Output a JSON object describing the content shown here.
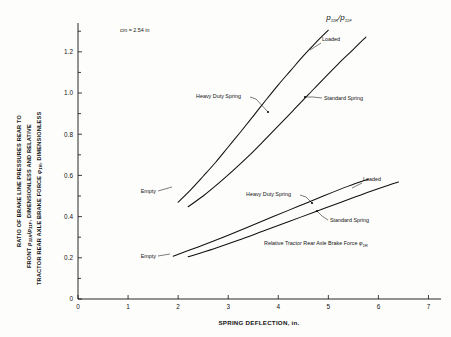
{
  "figure": {
    "note": "cm = 2.54 in",
    "formula_main": "p",
    "formula_sub1": "11R",
    "formula_slash": "/",
    "formula_main2": "p",
    "formula_sub2": "11F"
  },
  "axes": {
    "x": {
      "label": "SPRING DEFLECTION, in.",
      "ticks": [
        0,
        1,
        2,
        3,
        4,
        5,
        6,
        7
      ],
      "tick_labels": [
        "0",
        "1",
        "2",
        "3",
        "4",
        "5",
        "6",
        "7"
      ],
      "min": 0,
      "max": 7.25
    },
    "y": {
      "label_line1": "RATIO OF BRAKE LINE PRESSURES REAR  TO",
      "label_line2_a": "FRONT ",
      "label_line2_p1": "p",
      "label_line2_s1": "11R",
      "label_line2_slash": "/",
      "label_line2_p2": "p",
      "label_line2_s2": "11F",
      "label_line2_b": ", DIMENSIONLESS  AND RELATIVE",
      "label_line3_a": "TRACTOR REAR AXLE BRAKE FORCE ",
      "label_line3_phi": "φ",
      "label_line3_s": "1R",
      "label_line3_b": ", DIMENSIONLESS",
      "ticks": [
        0,
        0.2,
        0.4,
        0.6,
        0.8,
        1.0,
        1.2
      ],
      "tick_labels": [
        "0",
        "0.2",
        "0.4",
        "0.6",
        "0.8",
        "1.0",
        "1.2"
      ],
      "minor_ticks": [
        0.1,
        0.3,
        0.5,
        0.7,
        0.9,
        1.1,
        1.3
      ],
      "min": 0,
      "max": 1.34
    }
  },
  "annotations": {
    "upper_loaded": "Loaded",
    "upper_empty": "Empty",
    "upper_heavy": "Heavy Duty Spring",
    "upper_standard": "Standard Spring",
    "lower_loaded": "Loaded",
    "lower_empty": "Empty",
    "lower_heavy": "Heavy Duty Spring",
    "lower_standard": "Standard Spring",
    "relative_a": "Relative Tractor Rear  Axle Brake Force ",
    "relative_phi": "φ",
    "relative_sub": "1R"
  },
  "chart_data": {
    "type": "line",
    "title": "",
    "xlabel": "SPRING DEFLECTION, in.",
    "ylabel": "RATIO OF BRAKE LINE PRESSURES REAR TO FRONT p11R/p11F, DIMENSIONLESS AND RELATIVE TRACTOR REAR AXLE BRAKE FORCE phi-1R, DIMENSIONLESS",
    "xlim": [
      0,
      7.25
    ],
    "ylim": [
      0,
      1.34
    ],
    "grid": false,
    "legend": "inline-annotations",
    "series": [
      {
        "name": "Heavy Duty Spring (pressure ratio p11R/p11F)",
        "group": "upper",
        "start_label": "Empty",
        "end_label": "Loaded",
        "points": [
          [
            2.0,
            0.47
          ],
          [
            2.25,
            0.53
          ],
          [
            2.5,
            0.596
          ],
          [
            2.75,
            0.664
          ],
          [
            3.0,
            0.738
          ],
          [
            3.25,
            0.812
          ],
          [
            3.5,
            0.888
          ],
          [
            3.75,
            0.965
          ],
          [
            4.0,
            1.04
          ],
          [
            4.25,
            1.11
          ],
          [
            4.5,
            1.18
          ],
          [
            4.75,
            1.245
          ],
          [
            5.0,
            1.305
          ]
        ]
      },
      {
        "name": "Standard Spring (pressure ratio p11R/p11F)",
        "group": "upper",
        "start_label": "Empty",
        "end_label": "Loaded",
        "points": [
          [
            2.2,
            0.448
          ],
          [
            2.5,
            0.5
          ],
          [
            2.8,
            0.56
          ],
          [
            3.1,
            0.624
          ],
          [
            3.4,
            0.692
          ],
          [
            3.7,
            0.765
          ],
          [
            4.0,
            0.84
          ],
          [
            4.3,
            0.916
          ],
          [
            4.6,
            0.992
          ],
          [
            4.9,
            1.068
          ],
          [
            5.2,
            1.142
          ],
          [
            5.5,
            1.212
          ],
          [
            5.75,
            1.272
          ]
        ]
      },
      {
        "name": "Heavy Duty Spring (relative rear axle brake force phi-1R)",
        "group": "lower",
        "start_label": "Empty",
        "end_label": "Loaded",
        "points": [
          [
            1.9,
            0.208
          ],
          [
            2.4,
            0.253
          ],
          [
            2.9,
            0.3
          ],
          [
            3.4,
            0.35
          ],
          [
            3.9,
            0.4
          ],
          [
            4.4,
            0.45
          ],
          [
            4.9,
            0.5
          ],
          [
            5.4,
            0.548
          ],
          [
            5.8,
            0.582
          ]
        ]
      },
      {
        "name": "Standard Spring (relative rear axle brake force phi-1R)",
        "group": "lower",
        "start_label": "Empty",
        "end_label": "Loaded",
        "points": [
          [
            2.2,
            0.205
          ],
          [
            2.7,
            0.243
          ],
          [
            3.2,
            0.285
          ],
          [
            3.7,
            0.33
          ],
          [
            4.2,
            0.375
          ],
          [
            4.7,
            0.42
          ],
          [
            5.2,
            0.465
          ],
          [
            5.7,
            0.51
          ],
          [
            6.2,
            0.552
          ],
          [
            6.4,
            0.568
          ]
        ]
      }
    ]
  }
}
